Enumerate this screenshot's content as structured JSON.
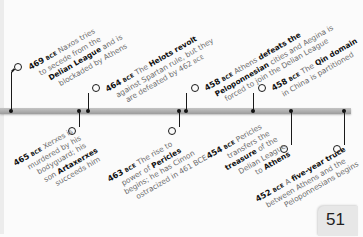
{
  "page_number": "51",
  "era_suffix": "BCE",
  "events": [
    {
      "year": "469",
      "position": "above",
      "parts": [
        {
          "t": "Naxos tries to secede from the",
          "b": false
        },
        {
          "t": "Delian League",
          "b": true
        },
        {
          "t": "and is blockaded by Athens",
          "b": false
        }
      ],
      "lines": [
        "Naxos tries",
        "to secede from the",
        "Delian League and is",
        "blockaded by Athens"
      ]
    },
    {
      "year": "465",
      "position": "below",
      "lines": [
        "Xerxes is",
        "murdered by his",
        "bodyguard; his",
        "son Artaxerxes",
        "succeeds him"
      ]
    },
    {
      "year": "464",
      "position": "above",
      "lines": [
        "The Helots revolt",
        "against Spartan rule, but they",
        "are defeated by 462 BCE"
      ]
    },
    {
      "year": "463",
      "position": "below",
      "lines": [
        "The rise to",
        "power of Pericles",
        "begins; he has Cimon",
        "ostracized in 461 BCE"
      ]
    },
    {
      "year": "458",
      "position": "above",
      "lines": [
        "Athens defeats the",
        "Peloponnesian cities and Aegina is",
        "forced to join the Delian League"
      ]
    },
    {
      "year": "458",
      "position": "above",
      "lines": [
        "The Qin domain",
        "in China is partitioned"
      ]
    },
    {
      "year": "454",
      "position": "below",
      "lines": [
        "Pericles",
        "transfers the",
        "treasure of the",
        "Delian League",
        "to Athens"
      ]
    },
    {
      "year": "452",
      "position": "below",
      "lines": [
        "A five-year truce",
        "between Athens and the",
        "Peloponnesians begins"
      ]
    }
  ],
  "bold_phrases": [
    "Delian League",
    "The Helots revolt",
    "Artaxerxes",
    "Pericles",
    "defeats the",
    "Peloponnesian",
    "The Qin domain",
    "treasure",
    "Athens",
    "five-year truce"
  ]
}
